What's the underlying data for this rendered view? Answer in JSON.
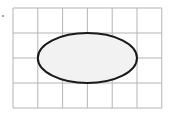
{
  "diagram": {
    "type": "grid-with-ellipse",
    "grid": {
      "columns": 6,
      "rows": 4,
      "origin_x": 13,
      "origin_y": 8,
      "cell_width": 24.8,
      "cell_height": 25,
      "line_color": "#b4b4b4"
    },
    "ellipse": {
      "center_col": 3,
      "center_row": 2,
      "semi_axis_cols": 2,
      "semi_axis_rows": 1,
      "fill": "#f2f2f2",
      "stroke": "#1a1a1a",
      "stroke_width": 2
    },
    "marker_dot_color": "#888888"
  }
}
